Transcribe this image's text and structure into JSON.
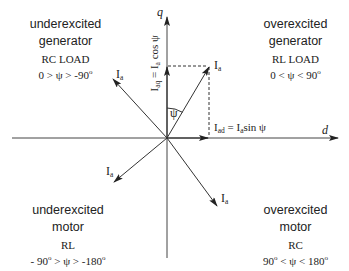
{
  "diagram": {
    "type": "phasor-diagram",
    "axes": {
      "q_label": "q",
      "d_label": "d"
    },
    "phasor_label": "I",
    "phasor_sub": "a",
    "angle_label": "ψ",
    "components": {
      "iaq": {
        "main": "I",
        "sub": "aq",
        "eq": " = I",
        "sub2": "a",
        "tail": " cos ψ"
      },
      "iad": {
        "main": "I",
        "sub": "ad",
        "eq": " = I",
        "sub2": "a",
        "tail": "sin ψ"
      }
    },
    "quadrants": {
      "top_left": {
        "line1": "underexcited",
        "line2": "generator",
        "load": "RC LOAD",
        "condition": "0 > ψ  > -90",
        "deg": "o"
      },
      "top_right": {
        "line1": "overexcited",
        "line2": "generator",
        "load": "RL LOAD",
        "condition": "0 <  ψ  < 90",
        "deg": "o"
      },
      "bottom_left": {
        "line1": "underexcited",
        "line2": "motor",
        "load": "RL",
        "condition_a": "- 90",
        "condition_b": " > ψ  > -180",
        "deg": "o"
      },
      "bottom_right": {
        "line1": "overexcited",
        "line2": "motor",
        "load": "RC",
        "condition_a": "90",
        "condition_b": " <  ψ  < 180",
        "deg": "o"
      }
    },
    "colors": {
      "line": "#333333",
      "text": "#222222",
      "background": "#ffffff"
    }
  }
}
